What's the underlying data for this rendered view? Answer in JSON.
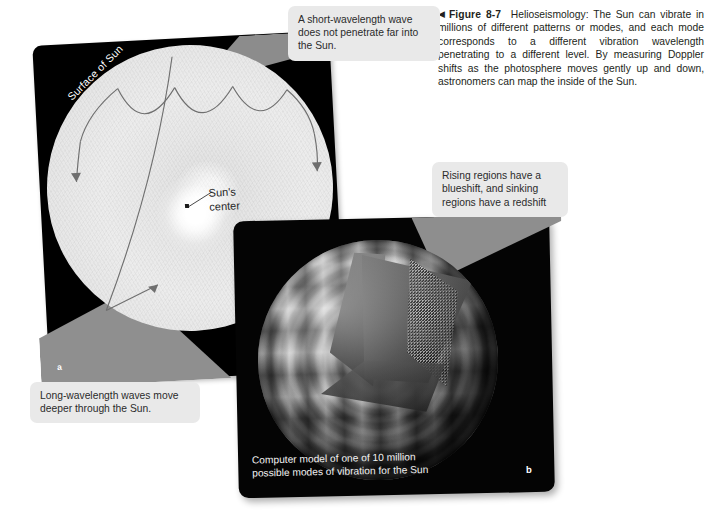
{
  "figure": {
    "arrow_glyph": "◀",
    "label": "Figure 8-7",
    "caption": "Helioseismology: The Sun can vibrate in millions of different patterns or modes, and each mode corresponds to a different vibration wavelength penetrating to a different level. By measuring Doppler shifts as the photosphere moves gently up and down, astronomers can map the inside of the Sun."
  },
  "credit": {
    "text": "Panel a: © 2016 Cengage Learning®; Panel b: AURA/NOAO/NSF"
  },
  "panel_a": {
    "letter": "a",
    "labels": {
      "surface_of_sun": "Surface of Sun",
      "sun_center_line1": "Sun's",
      "sun_center_line2": "center"
    }
  },
  "panel_b": {
    "letter": "b",
    "caption_line1": "Computer model of one of 10 million",
    "caption_line2": "possible modes of vibration for the Sun"
  },
  "callouts": {
    "short_wavelength": "A short-wavelength wave does not penetrate far into the Sun.",
    "long_wavelength": "Long-wavelength waves move deeper through the Sun.",
    "rising_regions": "Rising regions have a blueshift, and sinking regions have a redshift"
  },
  "colors": {
    "page_background": "#ffffff",
    "panel_dark": "#040404",
    "wedge_gray": "#8e8e8e",
    "callout_background": "#e9e9e9",
    "text": "#231f20",
    "ray_line": "#6b6b6b"
  }
}
